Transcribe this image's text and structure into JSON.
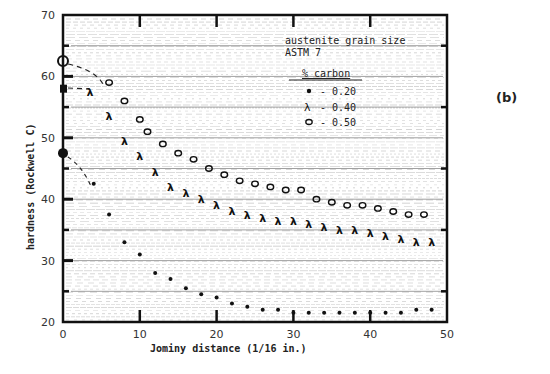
{
  "panel_label": "(b)",
  "chart_data": {
    "type": "scatter",
    "title": "",
    "xlabel": "Jominy distance (1/16 in.)",
    "ylabel": "hardness (Rockwell C)",
    "xlim": [
      0,
      50
    ],
    "ylim": [
      20,
      70
    ],
    "xticks": [
      0,
      10,
      20,
      30,
      40,
      50
    ],
    "yticks": [
      20,
      30,
      40,
      50,
      60,
      70
    ],
    "grid": true,
    "annotation": [
      "austenite grain size",
      "ASTM 7"
    ],
    "legend_title": "% carbon",
    "legend_position": "upper right",
    "series": [
      {
        "name": "0.20",
        "marker": "dot",
        "x": [
          0,
          4,
          6,
          8,
          10,
          12,
          14,
          16,
          18,
          20,
          22,
          24,
          26,
          28,
          30,
          32,
          34,
          36,
          38,
          40,
          42,
          44,
          46,
          48
        ],
        "y": [
          47.5,
          42.5,
          37.5,
          33,
          31,
          28,
          27,
          25.5,
          24.5,
          24,
          23,
          22.5,
          22,
          22,
          21.5,
          21.5,
          21.5,
          21.5,
          21.5,
          21.5,
          21.5,
          21.5,
          22,
          22
        ]
      },
      {
        "name": "0.40",
        "marker": "x",
        "x": [
          0,
          3.5,
          6,
          8,
          10,
          12,
          14,
          16,
          18,
          20,
          22,
          24,
          26,
          28,
          30,
          32,
          34,
          36,
          38,
          40,
          42,
          44,
          46,
          48
        ],
        "y": [
          58,
          57.5,
          53.5,
          49.5,
          47,
          44.5,
          42,
          41,
          40,
          39,
          38,
          37.5,
          37,
          36.5,
          36.5,
          36,
          35.5,
          35,
          35,
          34.5,
          34,
          33.5,
          33,
          33
        ]
      },
      {
        "name": "0.50",
        "marker": "circle",
        "x": [
          0,
          6,
          8,
          10,
          11,
          13,
          15,
          17,
          19,
          21,
          23,
          25,
          27,
          29,
          31,
          33,
          35,
          37,
          39,
          41,
          43,
          45,
          47
        ],
        "y": [
          62.5,
          59,
          56,
          53,
          51,
          49,
          47.5,
          46.5,
          45,
          44,
          43,
          42.5,
          42,
          41.5,
          41.5,
          40,
          39.5,
          39,
          39,
          38.5,
          38,
          37.5,
          37.5
        ]
      }
    ]
  },
  "legend": {
    "annotation_line1": "austenite grain size",
    "annotation_line2": "ASTM 7",
    "title": "% carbon",
    "items": [
      {
        "marker": "dot",
        "label": "- 0.20"
      },
      {
        "marker": "x",
        "label": "- 0.40"
      },
      {
        "marker": "circle",
        "label": "- 0.50"
      }
    ]
  },
  "axes": {
    "xlabel": "Jominy distance (1/16 in.)",
    "ylabel": "hardness (Rockwell C)"
  }
}
